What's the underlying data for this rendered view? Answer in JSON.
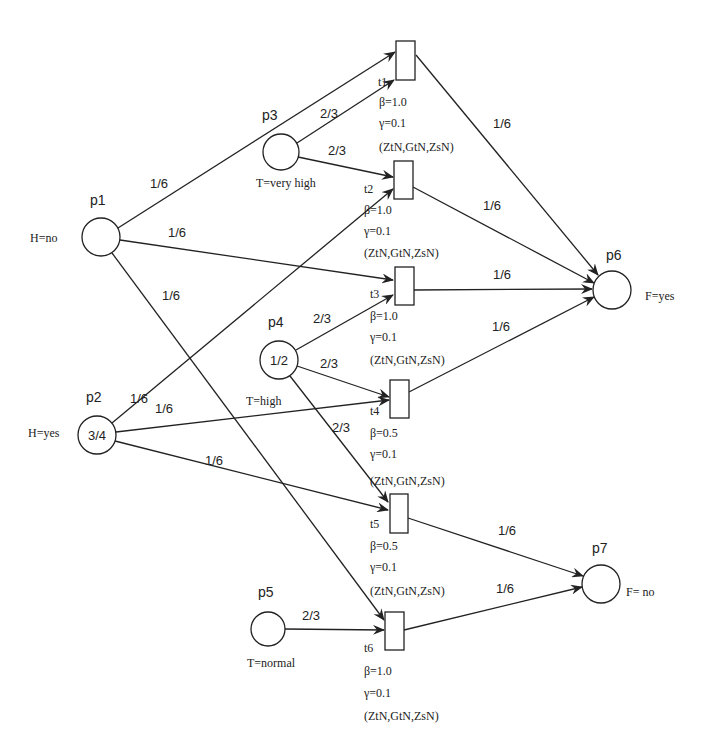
{
  "diagram": {
    "type": "petri-net",
    "places": [
      {
        "id": "p1",
        "label": "p1",
        "annotation": "H=no",
        "marking": "",
        "cx": 101,
        "cy": 237,
        "r": 19,
        "label_pos": [
          90,
          205
        ],
        "ann_pos": [
          30,
          242
        ],
        "ann_anchor": "start"
      },
      {
        "id": "p2",
        "label": "p2",
        "annotation": "H=yes",
        "marking": "3/4",
        "cx": 97,
        "cy": 435,
        "r": 19,
        "label_pos": [
          86,
          402
        ],
        "ann_pos": [
          28,
          437
        ],
        "ann_anchor": "start"
      },
      {
        "id": "p3",
        "label": "p3",
        "annotation": "T=very high",
        "marking": "",
        "cx": 281,
        "cy": 152,
        "r": 18,
        "label_pos": [
          262,
          120
        ],
        "ann_pos": [
          256,
          187
        ],
        "ann_anchor": "start"
      },
      {
        "id": "p4",
        "label": "p4",
        "annotation": "T=high",
        "marking": "1/2",
        "cx": 279,
        "cy": 360,
        "r": 19,
        "label_pos": [
          268,
          327
        ],
        "ann_pos": [
          246,
          405
        ],
        "ann_anchor": "start"
      },
      {
        "id": "p5",
        "label": "p5",
        "annotation": "T=normal",
        "marking": "",
        "cx": 268,
        "cy": 629,
        "r": 17,
        "label_pos": [
          258,
          597
        ],
        "ann_pos": [
          247,
          667
        ],
        "ann_anchor": "start"
      },
      {
        "id": "p6",
        "label": "p6",
        "annotation": "F=yes",
        "marking": "",
        "cx": 612,
        "cy": 290,
        "r": 19,
        "label_pos": [
          606,
          260
        ],
        "ann_pos": [
          645,
          300
        ],
        "ann_anchor": "start"
      },
      {
        "id": "p7",
        "label": "p7",
        "annotation": "F= no",
        "marking": "",
        "cx": 601,
        "cy": 584,
        "r": 19,
        "label_pos": [
          592,
          553
        ],
        "ann_pos": [
          626,
          596
        ],
        "ann_anchor": "start"
      }
    ],
    "transitions": [
      {
        "id": "t1",
        "label": "t1",
        "beta": "β=1.0",
        "gamma": "γ=0.1",
        "params": "(ZtN,GtN,ZsN)",
        "x": 396,
        "y": 41,
        "w": 19,
        "h": 39,
        "label_pos": [
          378,
          86
        ],
        "params_x": [
          379,
          106,
          127,
          151
        ]
      },
      {
        "id": "t2",
        "label": "t2",
        "beta": "β=1.0",
        "gamma": "γ=0.1",
        "params": "(ZtN,GtN,ZsN)",
        "x": 394,
        "y": 161,
        "w": 19,
        "h": 38,
        "label_pos": [
          364,
          193
        ],
        "params_x": [
          364,
          214,
          235,
          257
        ]
      },
      {
        "id": "t3",
        "label": "t3",
        "beta": "β=1.0",
        "gamma": "γ=0.1",
        "params": "(ZtN,GtN,ZsN)",
        "x": 395,
        "y": 267,
        "w": 19,
        "h": 38,
        "label_pos": [
          370,
          298
        ],
        "params_x": [
          370,
          320,
          341,
          364
        ]
      },
      {
        "id": "t4",
        "label": "t4",
        "beta": "β=0.5",
        "gamma": "γ=0.1",
        "params": "(ZtN,GtN,ZsN)",
        "x": 390,
        "y": 380,
        "w": 19,
        "h": 38,
        "label_pos": [
          370,
          415
        ],
        "params_x": [
          370,
          437,
          458,
          485
        ]
      },
      {
        "id": "t5",
        "label": "t5",
        "beta": "β=0.5",
        "gamma": "γ=0.1",
        "params": "(ZtN,GtN,ZsN)",
        "x": 390,
        "y": 494,
        "w": 18,
        "h": 39,
        "label_pos": [
          370,
          528
        ],
        "params_x": [
          370,
          550,
          571,
          595
        ]
      },
      {
        "id": "t6",
        "label": "t6",
        "beta": "β=1.0",
        "gamma": "γ=0.1",
        "params": "(ZtN,GtN,ZsN)",
        "x": 385,
        "y": 612,
        "w": 19,
        "h": 38,
        "label_pos": [
          364,
          652
        ],
        "params_x": [
          364,
          675,
          697,
          720
        ]
      }
    ],
    "arcs": [
      {
        "from": "p1",
        "to": "t1",
        "weight": "1/6",
        "x1": 118,
        "y1": 228,
        "x2": 395,
        "y2": 52,
        "label_pos": [
          150,
          188
        ]
      },
      {
        "from": "p3",
        "to": "t1",
        "weight": "2/3",
        "x1": 297,
        "y1": 143,
        "x2": 394,
        "y2": 80,
        "label_pos": [
          320,
          118
        ]
      },
      {
        "from": "p3",
        "to": "t2",
        "weight": "2/3",
        "x1": 298,
        "y1": 157,
        "x2": 393,
        "y2": 177,
        "label_pos": [
          328,
          155
        ]
      },
      {
        "from": "p2",
        "to": "t2",
        "weight": "1/6",
        "x1": 112,
        "y1": 423,
        "x2": 393,
        "y2": 189,
        "label_pos": [
          130,
          403
        ]
      },
      {
        "from": "p1",
        "to": "t3",
        "weight": "1/6",
        "x1": 120,
        "y1": 240,
        "x2": 393,
        "y2": 280,
        "label_pos": [
          168,
          237
        ]
      },
      {
        "from": "p4",
        "to": "t3",
        "weight": "2/3",
        "x1": 296,
        "y1": 350,
        "x2": 393,
        "y2": 295,
        "label_pos": [
          313,
          323
        ]
      },
      {
        "from": "p4",
        "to": "t4",
        "weight": "2/3",
        "x1": 297,
        "y1": 366,
        "x2": 389,
        "y2": 397,
        "label_pos": [
          320,
          368
        ]
      },
      {
        "from": "p2",
        "to": "t4",
        "weight": "1/6",
        "x1": 116,
        "y1": 432,
        "x2": 389,
        "y2": 400,
        "label_pos": [
          155,
          413
        ]
      },
      {
        "from": "p4",
        "to": "t5",
        "weight": "2/3",
        "x1": 290,
        "y1": 376,
        "x2": 388,
        "y2": 502,
        "label_pos": [
          332,
          432
        ]
      },
      {
        "from": "p2",
        "to": "t5",
        "weight": "1/6",
        "x1": 115,
        "y1": 441,
        "x2": 388,
        "y2": 510,
        "label_pos": [
          205,
          465
        ]
      },
      {
        "from": "p1",
        "to": "t6",
        "weight": "1/6",
        "x1": 112,
        "y1": 253,
        "x2": 384,
        "y2": 620,
        "label_pos": [
          162,
          300
        ]
      },
      {
        "from": "p5",
        "to": "t6",
        "weight": "2/3",
        "x1": 285,
        "y1": 629,
        "x2": 384,
        "y2": 630,
        "label_pos": [
          302,
          620
        ]
      },
      {
        "from": "t1",
        "to": "p6",
        "weight": "1/6",
        "x1": 416,
        "y1": 55,
        "x2": 598,
        "y2": 275,
        "label_pos": [
          493,
          128
        ]
      },
      {
        "from": "t2",
        "to": "p6",
        "weight": "1/6",
        "x1": 413,
        "y1": 187,
        "x2": 594,
        "y2": 283,
        "label_pos": [
          483,
          210
        ]
      },
      {
        "from": "t3",
        "to": "p6",
        "weight": "1/6",
        "x1": 414,
        "y1": 290,
        "x2": 592,
        "y2": 289,
        "label_pos": [
          493,
          279
        ]
      },
      {
        "from": "t4",
        "to": "p6",
        "weight": "1/6",
        "x1": 409,
        "y1": 392,
        "x2": 594,
        "y2": 297,
        "label_pos": [
          492,
          331
        ]
      },
      {
        "from": "t5",
        "to": "p7",
        "weight": "1/6",
        "x1": 408,
        "y1": 518,
        "x2": 583,
        "y2": 576,
        "label_pos": [
          498,
          535
        ]
      },
      {
        "from": "t6",
        "to": "p7",
        "weight": "1/6",
        "x1": 404,
        "y1": 630,
        "x2": 582,
        "y2": 587,
        "label_pos": [
          496,
          593
        ]
      }
    ]
  }
}
